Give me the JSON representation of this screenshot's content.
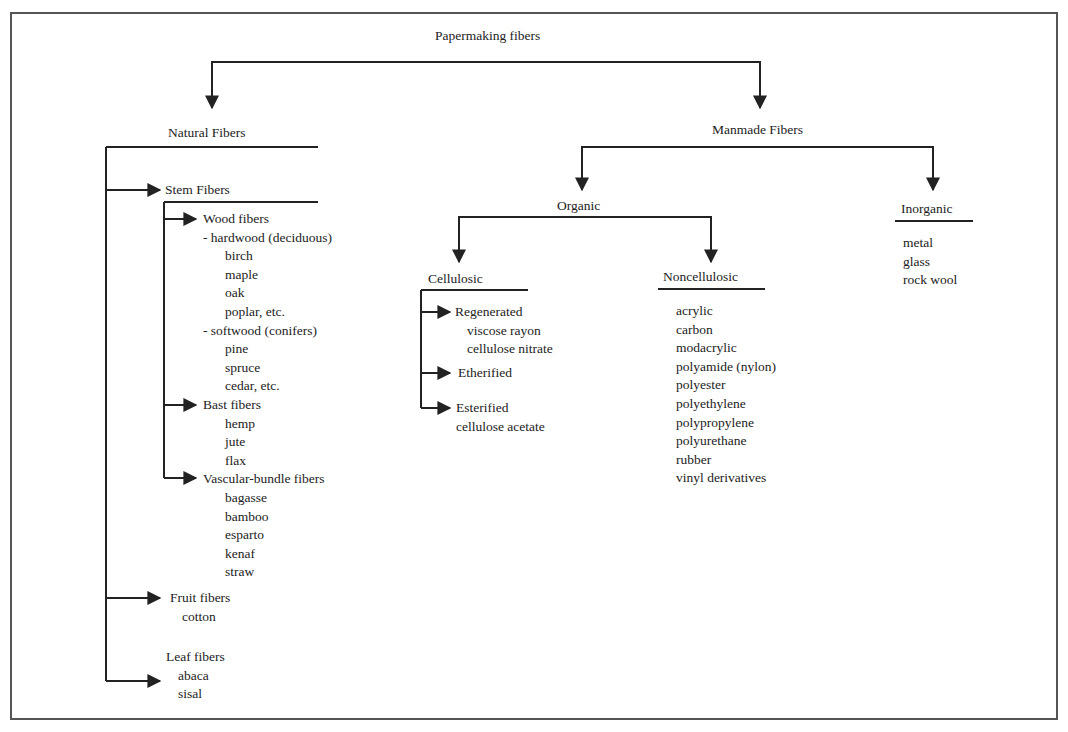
{
  "title": "Papermaking fibers",
  "natural": {
    "label": "Natural Fibers",
    "stem": {
      "label": "Stem Fibers",
      "wood": {
        "label": "Wood fibers",
        "hardwood": {
          "label": "- hardwood (deciduous)",
          "items": [
            "birch",
            "maple",
            "oak",
            "poplar, etc."
          ]
        },
        "softwood": {
          "label": "- softwood (conifers)",
          "items": [
            "pine",
            "spruce",
            "cedar, etc."
          ]
        }
      },
      "bast": {
        "label": "Bast fibers",
        "items": [
          "hemp",
          "jute",
          "flax"
        ]
      },
      "vascular": {
        "label": "Vascular-bundle fibers",
        "items": [
          "bagasse",
          "bamboo",
          "esparto",
          "kenaf",
          "straw"
        ]
      }
    },
    "fruit": {
      "label": "Fruit fibers",
      "items": [
        "cotton"
      ]
    },
    "leaf": {
      "label": "Leaf fibers",
      "items": [
        "abaca",
        "sisal"
      ]
    }
  },
  "manmade": {
    "label": "Manmade Fibers",
    "organic": {
      "label": "Organic",
      "cellulosic": {
        "label": "Cellulosic",
        "regenerated": {
          "label": "Regenerated",
          "items": [
            "viscose rayon",
            "cellulose nitrate"
          ]
        },
        "etherified": {
          "label": "Etherified"
        },
        "esterified": {
          "label": "Esterified",
          "items": [
            "cellulose acetate"
          ]
        }
      },
      "noncellulosic": {
        "label": "Noncellulosic",
        "items": [
          "acrylic",
          "carbon",
          "modacrylic",
          "polyamide (nylon)",
          "polyester",
          "polyethylene",
          "polypropylene",
          "polyurethane",
          "rubber",
          "vinyl derivatives"
        ]
      }
    },
    "inorganic": {
      "label": "Inorganic",
      "items": [
        "metal",
        "glass",
        "rock wool"
      ]
    }
  },
  "colors": {
    "line": "#222222",
    "frame": "#555555",
    "text": "#222222"
  }
}
